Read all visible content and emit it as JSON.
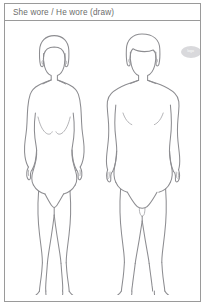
{
  "page": {
    "title": "She wore / He wore (draw)",
    "frame_color": "#9a9a9a",
    "background_color": "#ffffff",
    "line_color": "#8d8d91"
  },
  "header": {
    "prompt_label": "She wore / He wore (draw)"
  },
  "stamp": {
    "label": "logo",
    "shape": "oval",
    "color": "#d9d9dc"
  },
  "figures": [
    {
      "name": "female-croquis",
      "label": "She wore",
      "pose": "front-facing standing, arms at sides",
      "hair": "chin-length bob",
      "icon": "female-body-outline-icon"
    },
    {
      "name": "male-croquis",
      "label": "He wore",
      "pose": "front-facing standing, arms at sides",
      "hair": "short side-parted",
      "icon": "male-body-outline-icon"
    }
  ]
}
